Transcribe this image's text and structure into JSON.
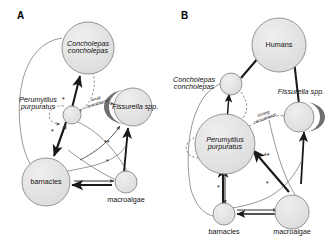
{
  "figure": {
    "background": "#ffffff",
    "node_fill": "#e2e2e2",
    "node_stroke": "#8a8a8a",
    "crescent_fill": "#6f6f6f",
    "arrow_color": "#1a1a1a",
    "thin_line_color": "#6a6a6a"
  },
  "panels": [
    {
      "letter": "A",
      "nodes": [
        {
          "id": "concholepas",
          "label_line1": "Concholepas",
          "label_line2": "concholepas",
          "label_position": "inside",
          "italic": true,
          "size": "large"
        },
        {
          "id": "perumytilus",
          "label_line1": "Perumytilus",
          "label_line2": "purpuratus",
          "label_position": "outside-left",
          "italic": true,
          "size": "small"
        },
        {
          "id": "fissurella",
          "label_line1": "Fissurella spp.",
          "label_line2": "",
          "label_position": "inside",
          "italic": true,
          "size": "large",
          "crescent": "left"
        },
        {
          "id": "barnacles",
          "label_line1": "barnacles",
          "label_line2": "",
          "label_position": "inside",
          "italic": false,
          "size": "large"
        },
        {
          "id": "macroalgae",
          "label_line1": "macroalgae",
          "label_line2": "",
          "label_position": "below",
          "italic": false,
          "size": "small"
        }
      ],
      "annotations": [
        {
          "id": "recruitment",
          "line1": "weak",
          "line2": "recruitment"
        }
      ],
      "asterisks": [
        "*",
        "*",
        "**",
        "*"
      ]
    },
    {
      "letter": "B",
      "nodes": [
        {
          "id": "humans",
          "label_line1": "Humans",
          "label_line2": "",
          "label_position": "inside",
          "italic": false,
          "size": "large"
        },
        {
          "id": "concholepas",
          "label_line1": "Concholepas",
          "label_line2": "concholepas",
          "label_position": "outside-left",
          "italic": true,
          "size": "small"
        },
        {
          "id": "perumytilus",
          "label_line1": "Perumytilus",
          "label_line2": "purpuratus",
          "label_position": "inside",
          "italic": true,
          "size": "large"
        },
        {
          "id": "fissurella",
          "label_line1": "Fissurella spp.",
          "label_line2": "",
          "label_position": "above",
          "italic": true,
          "size": "small",
          "crescent": "right"
        },
        {
          "id": "barnacles",
          "label_line1": "barnacles",
          "label_line2": "",
          "label_position": "below",
          "italic": false,
          "size": "small"
        },
        {
          "id": "macroalgae",
          "label_line1": "macroalgae",
          "label_line2": "",
          "label_position": "below",
          "italic": false,
          "size": "large"
        }
      ],
      "annotations": [
        {
          "id": "recruitment",
          "line1": "strong",
          "line2": "recruitment"
        }
      ],
      "asterisks": [
        "*",
        "**",
        "*"
      ]
    }
  ]
}
